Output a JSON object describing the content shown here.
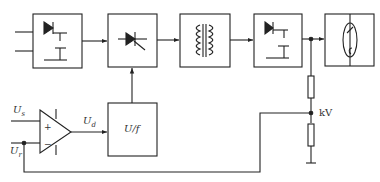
{
  "diagram": {
    "type": "block-diagram",
    "blocks": [
      {
        "id": "rectifier-filter",
        "symbol": "diode-capacitor"
      },
      {
        "id": "thyristor-regulator",
        "symbol": "thyristor"
      },
      {
        "id": "transformer",
        "symbol": "transformer-coils"
      },
      {
        "id": "hv-rectifier-filter",
        "symbol": "diode-capacitor"
      },
      {
        "id": "x-ray-tube",
        "symbol": "tube"
      },
      {
        "id": "voltage-to-frequency",
        "label": "U/f"
      }
    ],
    "labels": {
      "setpoint": "U",
      "setpoint_sub": "s",
      "feedback": "U",
      "feedback_sub": "r",
      "error": "U",
      "error_sub": "d",
      "vf_block": "U/f",
      "divider_node": "kV",
      "plus": "+",
      "minus": "−"
    },
    "colors": {
      "line": "#222222",
      "background": "#ffffff"
    }
  }
}
